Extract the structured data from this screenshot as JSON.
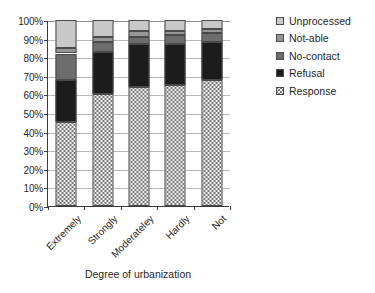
{
  "chart_data": {
    "type": "bar",
    "variant": "stacked-100-percent",
    "title": "",
    "xlabel": "Degree of urbanization",
    "ylabel": "",
    "ylim": [
      0,
      100
    ],
    "ytick_labels": [
      "100%",
      "90%",
      "80%",
      "70%",
      "60%",
      "50%",
      "40%",
      "30%",
      "20%",
      "10%",
      "0%"
    ],
    "ytick_values": [
      100,
      90,
      80,
      70,
      60,
      50,
      40,
      30,
      20,
      10,
      0
    ],
    "grid": true,
    "legend_position": "right",
    "categories": [
      "Extremely",
      "Strongly",
      "Moderateley",
      "Hardly",
      "Not"
    ],
    "series": [
      {
        "name": "Response",
        "color": "#f2f2f2",
        "pattern": "dotted",
        "values": [
          45,
          60,
          64,
          65,
          68
        ]
      },
      {
        "name": "Refusal",
        "color": "#1c1c1c",
        "pattern": "solid",
        "values": [
          23,
          23,
          23,
          22,
          20
        ]
      },
      {
        "name": "No-contact",
        "color": "#6d6d6d",
        "pattern": "solid",
        "values": [
          14,
          5,
          4,
          5,
          5
        ]
      },
      {
        "name": "Not-able",
        "color": "#969696",
        "pattern": "solid",
        "values": [
          3,
          3,
          3,
          2,
          2
        ]
      },
      {
        "name": "Unprocessed",
        "color": "#c8c8c8",
        "pattern": "solid",
        "values": [
          15,
          9,
          6,
          6,
          5
        ]
      }
    ],
    "legend_entries": [
      "Unprocessed",
      "Not-able",
      "No-contact",
      "Refusal",
      "Response"
    ]
  },
  "legend": {
    "items": [
      {
        "label": "Unprocessed",
        "swatch": "unprocessed"
      },
      {
        "label": "Not-able",
        "swatch": "notable"
      },
      {
        "label": "No-contact",
        "swatch": "nocontact"
      },
      {
        "label": "Refusal",
        "swatch": "refusal"
      },
      {
        "label": "Response",
        "swatch": "response"
      }
    ]
  },
  "axis": {
    "x_title": "Degree of urbanization"
  }
}
